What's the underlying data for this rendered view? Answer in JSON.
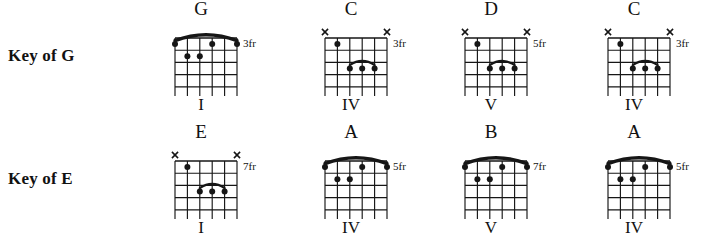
{
  "rows": [
    {
      "key_label": "Key of G",
      "chords": [
        {
          "name": "G",
          "numeral": "I",
          "fret_label": "3fr",
          "shape": "E-shape-barre",
          "barre": {
            "type": "full",
            "from_string": 6,
            "to_string": 1,
            "fret": 1
          },
          "muted_strings": [],
          "dots": [
            {
              "string": 6,
              "fret": 1
            },
            {
              "string": 1,
              "fret": 1
            },
            {
              "string": 3,
              "fret": 1
            },
            {
              "string": 5,
              "fret": 2
            },
            {
              "string": 4,
              "fret": 2
            }
          ]
        },
        {
          "name": "C",
          "numeral": "IV",
          "fret_label": "3fr",
          "shape": "A-shape-barre",
          "barre": {
            "type": "partial",
            "from_string": 4,
            "to_string": 2,
            "fret": 3
          },
          "muted_strings": [
            6,
            1
          ],
          "dots": [
            {
              "string": 5,
              "fret": 1
            },
            {
              "string": 4,
              "fret": 3
            },
            {
              "string": 3,
              "fret": 3
            },
            {
              "string": 2,
              "fret": 3
            }
          ]
        },
        {
          "name": "D",
          "numeral": "V",
          "fret_label": "5fr",
          "shape": "A-shape-barre",
          "barre": {
            "type": "partial",
            "from_string": 4,
            "to_string": 2,
            "fret": 3
          },
          "muted_strings": [
            6,
            1
          ],
          "dots": [
            {
              "string": 5,
              "fret": 1
            },
            {
              "string": 4,
              "fret": 3
            },
            {
              "string": 3,
              "fret": 3
            },
            {
              "string": 2,
              "fret": 3
            }
          ]
        },
        {
          "name": "C",
          "numeral": "IV",
          "fret_label": "3fr",
          "shape": "A-shape-barre",
          "barre": {
            "type": "partial",
            "from_string": 4,
            "to_string": 2,
            "fret": 3
          },
          "muted_strings": [
            6,
            1
          ],
          "dots": [
            {
              "string": 5,
              "fret": 1
            },
            {
              "string": 4,
              "fret": 3
            },
            {
              "string": 3,
              "fret": 3
            },
            {
              "string": 2,
              "fret": 3
            }
          ]
        }
      ]
    },
    {
      "key_label": "Key of E",
      "chords": [
        {
          "name": "E",
          "numeral": "I",
          "fret_label": "7fr",
          "shape": "A-shape-barre",
          "barre": {
            "type": "partial",
            "from_string": 4,
            "to_string": 2,
            "fret": 3
          },
          "muted_strings": [
            6,
            1
          ],
          "dots": [
            {
              "string": 5,
              "fret": 1
            },
            {
              "string": 4,
              "fret": 3
            },
            {
              "string": 3,
              "fret": 3
            },
            {
              "string": 2,
              "fret": 3
            }
          ]
        },
        {
          "name": "A",
          "numeral": "IV",
          "fret_label": "5fr",
          "shape": "E-shape-barre",
          "barre": {
            "type": "full",
            "from_string": 6,
            "to_string": 1,
            "fret": 1
          },
          "muted_strings": [],
          "dots": [
            {
              "string": 6,
              "fret": 1
            },
            {
              "string": 1,
              "fret": 1
            },
            {
              "string": 3,
              "fret": 1
            },
            {
              "string": 5,
              "fret": 2
            },
            {
              "string": 4,
              "fret": 2
            }
          ]
        },
        {
          "name": "B",
          "numeral": "V",
          "fret_label": "7fr",
          "shape": "E-shape-barre",
          "barre": {
            "type": "full",
            "from_string": 6,
            "to_string": 1,
            "fret": 1
          },
          "muted_strings": [],
          "dots": [
            {
              "string": 6,
              "fret": 1
            },
            {
              "string": 1,
              "fret": 1
            },
            {
              "string": 3,
              "fret": 1
            },
            {
              "string": 5,
              "fret": 2
            },
            {
              "string": 4,
              "fret": 2
            }
          ]
        },
        {
          "name": "A",
          "numeral": "IV",
          "fret_label": "5fr",
          "shape": "E-shape-barre",
          "barre": {
            "type": "full",
            "from_string": 6,
            "to_string": 1,
            "fret": 1
          },
          "muted_strings": [],
          "dots": [
            {
              "string": 6,
              "fret": 1
            },
            {
              "string": 1,
              "fret": 1
            },
            {
              "string": 3,
              "fret": 1
            },
            {
              "string": 5,
              "fret": 2
            },
            {
              "string": 4,
              "fret": 2
            }
          ]
        }
      ]
    }
  ],
  "geometry": {
    "strings": 6,
    "frets": 5,
    "row_x_positions": [
      165,
      315,
      455,
      598
    ],
    "muted_marker": "x",
    "ink_color": "#161616",
    "paper_color": "#ffffff"
  }
}
